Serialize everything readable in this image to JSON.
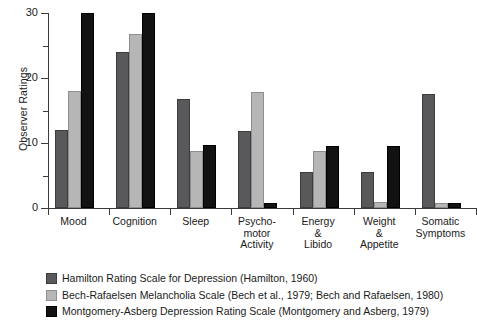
{
  "chart_data": {
    "type": "bar",
    "title": "",
    "xlabel": "",
    "ylabel": "Observer Ratings",
    "ylim": [
      0,
      30
    ],
    "yticks_major": [
      0,
      10,
      20,
      30
    ],
    "yticks_minor": [
      5,
      15,
      25
    ],
    "ytick_labels": [
      "0",
      "10",
      "20",
      "30"
    ],
    "grid": false,
    "legend_position": "below-plot-left",
    "categories": [
      "Mood",
      "Cognition",
      "Sleep",
      "Psycho-\nmotor\nActivity",
      "Energy\n&\nLibido",
      "Weight\n&\nAppetite",
      "Somatic\nSymptoms"
    ],
    "series": [
      {
        "name": "Hamilton Rating Scale for Depression (Hamilton, 1960)",
        "color": "#59595b",
        "values": [
          12.0,
          24.0,
          16.8,
          11.8,
          5.5,
          5.5,
          17.5
        ]
      },
      {
        "name": "Bech-Rafaelsen Melancholia Scale (Bech et al., 1979; Bech and Rafaelsen, 1980)",
        "color": "#b6b6b6",
        "values": [
          18.0,
          26.8,
          8.7,
          17.8,
          8.7,
          0.9,
          0.7
        ]
      },
      {
        "name": "Montgomery-Asberg Depression Rating Scale (Montgomery and Asberg, 1979)",
        "color": "#121212",
        "values": [
          30.0,
          30.0,
          9.7,
          0.8,
          9.6,
          9.6,
          0.7
        ]
      }
    ]
  },
  "legend": {
    "items": [
      {
        "swatch": "s0",
        "label": "Hamilton Rating Scale for Depression (Hamilton, 1960)"
      },
      {
        "swatch": "s1",
        "label": "Bech-Rafaelsen Melancholia Scale (Bech et al., 1979; Bech and Rafaelsen, 1980)"
      },
      {
        "swatch": "s2",
        "label": "Montgomery-Asberg Depression Rating Scale (Montgomery and Asberg, 1979)"
      }
    ]
  }
}
